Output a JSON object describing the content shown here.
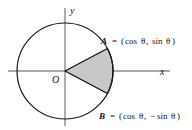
{
  "figure": {
    "background_color": "#ffffff",
    "axes": {
      "x_label": "x",
      "y_label": "y",
      "color": "#8c8c8c",
      "origin_label": "O"
    },
    "circle": {
      "center_x": 65,
      "center_y": 71,
      "radius": 48,
      "stroke_color": "#1a1a1a"
    },
    "sector": {
      "fill_color": "#c8c8c8",
      "stroke_color": "#111111",
      "start_angle_deg": 28,
      "end_angle_deg": -28
    },
    "points": [
      {
        "name": "A",
        "equals": "=",
        "open_paren": "(",
        "first_coord": "cos",
        "first_var": "θ",
        "comma": ",",
        "second_coord": "sin",
        "second_var": "θ",
        "second_sign": "",
        "close_paren": ")",
        "full_text": "A = (cos θ, sin θ)",
        "x": 99,
        "y": 48
      },
      {
        "name": "B",
        "equals": "=",
        "open_paren": "(",
        "first_coord": "cos",
        "first_var": "θ",
        "comma": ",",
        "second_coord": "sin",
        "second_var": "θ",
        "second_sign": "−",
        "close_paren": ")",
        "full_text": "B = (cos θ, −sin θ)",
        "x": 99,
        "y": 95
      }
    ]
  }
}
